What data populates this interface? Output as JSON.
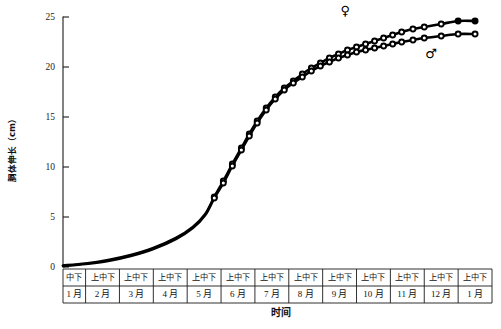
{
  "chart_data": {
    "type": "line",
    "title": "",
    "xlabel": "时间",
    "ylabel": "胴体伸长（cm）",
    "ylim": [
      0,
      25
    ],
    "yticks": [
      0,
      5,
      10,
      15,
      20,
      25
    ],
    "ytick_labels": [
      "0",
      "5",
      "10",
      "15",
      "20",
      "25"
    ],
    "grid": false,
    "legend_position": "inline-annotation",
    "x_axis_table": {
      "row_top_label": "旬",
      "row_bottom_label": "月",
      "cells": [
        {
          "top": "中下",
          "bottom": "1 月",
          "decades": 2
        },
        {
          "top": "上中下",
          "bottom": "2 月",
          "decades": 3
        },
        {
          "top": "上中下",
          "bottom": "3 月",
          "decades": 3
        },
        {
          "top": "上中下",
          "bottom": "4 月",
          "decades": 3
        },
        {
          "top": "上中下",
          "bottom": "5 月",
          "decades": 3
        },
        {
          "top": "上中下",
          "bottom": "6 月",
          "decades": 3
        },
        {
          "top": "上中下",
          "bottom": "7 月",
          "decades": 3
        },
        {
          "top": "上中下",
          "bottom": "8 月",
          "decades": 3
        },
        {
          "top": "上中下",
          "bottom": "9 月",
          "decades": 3
        },
        {
          "top": "上中下",
          "bottom": "10 月",
          "decades": 3
        },
        {
          "top": "上中下",
          "bottom": "11 月",
          "decades": 3
        },
        {
          "top": "上中下",
          "bottom": "12 月",
          "decades": 3
        },
        {
          "top": "上中下",
          "bottom": "1 月",
          "decades": 3
        }
      ]
    },
    "annotations": [
      {
        "name": "female-symbol",
        "text": "♀",
        "x_decade": 25.0,
        "y": 25.6
      },
      {
        "name": "male-symbol",
        "text": "♂",
        "x_decade": 32.6,
        "y": 21.3
      }
    ],
    "series": [
      {
        "name": "♀",
        "marker": "filled-circle",
        "end_value": 24.6,
        "points": [
          {
            "x": 0.0,
            "y": 0.15
          },
          {
            "x": 2.0,
            "y": 0.35
          },
          {
            "x": 4.0,
            "y": 0.7
          },
          {
            "x": 6.0,
            "y": 1.2
          },
          {
            "x": 8.0,
            "y": 1.9
          },
          {
            "x": 10.0,
            "y": 2.9
          },
          {
            "x": 11.5,
            "y": 4.0
          },
          {
            "x": 12.6,
            "y": 5.3
          },
          {
            "x": 13.4,
            "y": 7.0
          },
          {
            "x": 14.2,
            "y": 8.6
          },
          {
            "x": 15.0,
            "y": 10.3
          },
          {
            "x": 15.8,
            "y": 11.9
          },
          {
            "x": 16.5,
            "y": 13.3
          },
          {
            "x": 17.2,
            "y": 14.6
          },
          {
            "x": 18.0,
            "y": 15.9
          },
          {
            "x": 18.8,
            "y": 17.0
          },
          {
            "x": 19.6,
            "y": 17.9
          },
          {
            "x": 20.4,
            "y": 18.6
          },
          {
            "x": 21.2,
            "y": 19.3
          },
          {
            "x": 22.0,
            "y": 19.9
          },
          {
            "x": 22.8,
            "y": 20.4
          },
          {
            "x": 23.6,
            "y": 20.9
          },
          {
            "x": 24.4,
            "y": 21.3
          },
          {
            "x": 25.2,
            "y": 21.7
          },
          {
            "x": 26.0,
            "y": 22.0
          },
          {
            "x": 26.8,
            "y": 22.3
          },
          {
            "x": 27.6,
            "y": 22.6
          },
          {
            "x": 28.4,
            "y": 22.9
          },
          {
            "x": 29.2,
            "y": 23.2
          },
          {
            "x": 30.0,
            "y": 23.5
          },
          {
            "x": 31.0,
            "y": 23.8
          },
          {
            "x": 32.0,
            "y": 24.0
          },
          {
            "x": 33.5,
            "y": 24.3
          },
          {
            "x": 35.0,
            "y": 24.6
          },
          {
            "x": 36.5,
            "y": 24.6
          }
        ]
      },
      {
        "name": "♂",
        "marker": "open-circle",
        "end_value": 23.3,
        "points": [
          {
            "x": 0.0,
            "y": 0.1
          },
          {
            "x": 2.0,
            "y": 0.3
          },
          {
            "x": 4.0,
            "y": 0.6
          },
          {
            "x": 6.0,
            "y": 1.1
          },
          {
            "x": 8.0,
            "y": 1.8
          },
          {
            "x": 10.0,
            "y": 2.8
          },
          {
            "x": 11.5,
            "y": 3.9
          },
          {
            "x": 12.6,
            "y": 5.2
          },
          {
            "x": 13.4,
            "y": 6.9
          },
          {
            "x": 14.2,
            "y": 8.4
          },
          {
            "x": 15.0,
            "y": 10.1
          },
          {
            "x": 15.8,
            "y": 11.7
          },
          {
            "x": 16.5,
            "y": 13.1
          },
          {
            "x": 17.2,
            "y": 14.4
          },
          {
            "x": 18.0,
            "y": 15.7
          },
          {
            "x": 18.8,
            "y": 16.8
          },
          {
            "x": 19.6,
            "y": 17.7
          },
          {
            "x": 20.4,
            "y": 18.4
          },
          {
            "x": 21.2,
            "y": 19.0
          },
          {
            "x": 22.0,
            "y": 19.6
          },
          {
            "x": 22.8,
            "y": 20.1
          },
          {
            "x": 23.6,
            "y": 20.5
          },
          {
            "x": 24.4,
            "y": 20.9
          },
          {
            "x": 25.2,
            "y": 21.2
          },
          {
            "x": 26.0,
            "y": 21.5
          },
          {
            "x": 26.8,
            "y": 21.7
          },
          {
            "x": 27.6,
            "y": 21.9
          },
          {
            "x": 28.4,
            "y": 22.1
          },
          {
            "x": 29.2,
            "y": 22.3
          },
          {
            "x": 30.0,
            "y": 22.5
          },
          {
            "x": 31.0,
            "y": 22.7
          },
          {
            "x": 32.0,
            "y": 22.9
          },
          {
            "x": 33.5,
            "y": 23.1
          },
          {
            "x": 35.0,
            "y": 23.3
          },
          {
            "x": 36.5,
            "y": 23.3
          }
        ]
      }
    ]
  }
}
